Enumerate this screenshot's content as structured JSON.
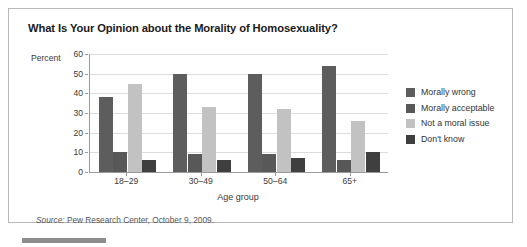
{
  "chart_title": "What Is Your Opinion about the Morality of Homosexuality?",
  "axes": {
    "y_title": "Percent",
    "x_title": "Age group"
  },
  "source": {
    "label": "Source:",
    "text": " Pew Research Center, October 9, 2009."
  },
  "chart_data": {
    "type": "bar",
    "title": "What Is Your Opinion about the Morality of Homosexuality?",
    "xlabel": "Age group",
    "ylabel": "Percent",
    "ylim": [
      0,
      60
    ],
    "yticks": [
      0,
      10,
      20,
      30,
      40,
      50,
      60
    ],
    "grid": true,
    "legend_position": "right",
    "categories": [
      "18–29",
      "30–49",
      "50–64",
      "65+"
    ],
    "series": [
      {
        "name": "Morally wrong",
        "color": "#5d5d5d",
        "values": [
          38,
          50,
          50,
          54
        ]
      },
      {
        "name": "Morally acceptable",
        "color": "#585858",
        "values": [
          10,
          9,
          9,
          6
        ]
      },
      {
        "name": "Not a moral issue",
        "color": "#c2c2c2",
        "values": [
          45,
          33,
          32,
          26
        ]
      },
      {
        "name": "Don't know",
        "color": "#3f3f3f",
        "values": [
          6,
          6,
          7,
          10
        ]
      }
    ]
  }
}
